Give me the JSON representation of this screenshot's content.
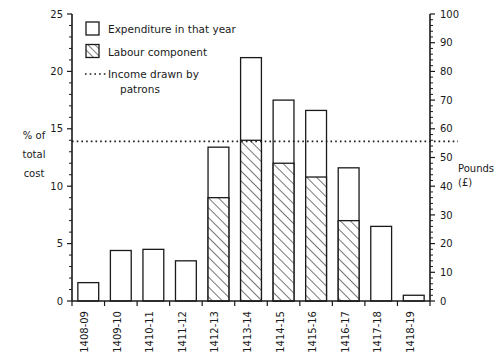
{
  "chart_data": {
    "type": "bar",
    "title": "",
    "xlabel": "",
    "ylabel": "% of total cost",
    "y2label": "Pounds (£)",
    "ylim": [
      0,
      25
    ],
    "y2lim": [
      0,
      100
    ],
    "grid": false,
    "legend_position": "top-left",
    "categories": [
      "1408-09",
      "1409-10",
      "1410-11",
      "1411-12",
      "1412-13",
      "1413-14",
      "1414-15",
      "1415-16",
      "1416-17",
      "1417-18",
      "1418-19"
    ],
    "series": [
      {
        "name": "Expenditure in that year",
        "values": [
          1.6,
          4.4,
          4.5,
          3.5,
          13.4,
          21.2,
          17.5,
          16.6,
          11.6,
          6.5,
          0.5
        ]
      },
      {
        "name": "Labour component",
        "values": [
          0,
          0,
          0,
          0,
          9.0,
          14.0,
          12.0,
          10.8,
          7.0,
          0,
          0
        ]
      }
    ],
    "annotations": [
      {
        "name": "Income drawn by patrons",
        "type": "hline",
        "value": 13.9
      }
    ],
    "yticks": [
      0,
      5,
      10,
      15,
      20,
      25
    ],
    "y2ticks": [
      0,
      10,
      20,
      30,
      40,
      50,
      60,
      70,
      80,
      90,
      100
    ]
  },
  "axes": {
    "left_title_lines": [
      "% of",
      "total",
      "cost"
    ],
    "right_title_lines": [
      "Pounds",
      "(£)"
    ]
  },
  "legend": {
    "items": [
      {
        "label": "Expenditure in that year",
        "swatch": "open-square"
      },
      {
        "label": "Labour component",
        "swatch": "hatched-square"
      },
      {
        "label": "Income drawn by",
        "label2": "patrons",
        "swatch": "dotted-line"
      }
    ]
  }
}
